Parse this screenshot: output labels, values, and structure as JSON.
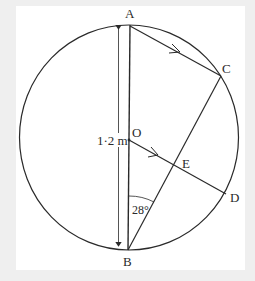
{
  "diagram": {
    "type": "circle-geometry",
    "points": {
      "A": "A",
      "B": "B",
      "C": "C",
      "D": "D",
      "E": "E",
      "O": "O"
    },
    "diameter_label": "1·2 m",
    "angle_label": "28°",
    "colors": {
      "line": "#2a2a2a",
      "background": "#ffffff",
      "frame": "#efefef"
    },
    "segments": [
      "AB (diameter)",
      "AC (arrow, parallel)",
      "OD (arrow, parallel)",
      "BC"
    ]
  }
}
